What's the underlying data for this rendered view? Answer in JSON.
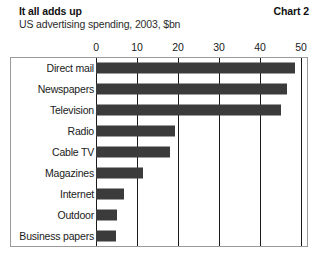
{
  "header": {
    "title": "It all adds up",
    "subtitle": "US advertising spending, 2003, $bn",
    "chart_number": "Chart 2"
  },
  "colors": {
    "bar": "#3b3b3b",
    "gridline": "#1a1a1a",
    "frame": "#9a9a9a",
    "background": "#ffffff",
    "text": "#1a1a1a"
  },
  "chart_data": {
    "type": "bar",
    "orientation": "horizontal",
    "title": "It all adds up",
    "subtitle": "US advertising spending, 2003, $bn",
    "xlabel": "",
    "ylabel": "",
    "xlim": [
      0,
      50
    ],
    "xticks": [
      0,
      10,
      20,
      30,
      40,
      50
    ],
    "xtick_labels": [
      "0",
      "10",
      "20",
      "30",
      "40",
      "50"
    ],
    "grid": "vertical",
    "legend": "none",
    "units": "$bn",
    "categories": [
      "Direct mail",
      "Newspapers",
      "Television",
      "Radio",
      "Cable TV",
      "Magazines",
      "Internet",
      "Outdoor",
      "Business papers"
    ],
    "values": [
      48.5,
      46.5,
      45.0,
      19.3,
      18.0,
      11.5,
      6.8,
      5.1,
      4.9
    ],
    "bars": [
      {
        "label": "Direct mail",
        "value": 48.5
      },
      {
        "label": "Newspapers",
        "value": 46.5
      },
      {
        "label": "Television",
        "value": 45.0
      },
      {
        "label": "Radio",
        "value": 19.3
      },
      {
        "label": "Cable TV",
        "value": 18.0
      },
      {
        "label": "Magazines",
        "value": 11.5
      },
      {
        "label": "Internet",
        "value": 6.8
      },
      {
        "label": "Outdoor",
        "value": 5.1
      },
      {
        "label": "Business papers",
        "value": 4.9
      }
    ]
  }
}
